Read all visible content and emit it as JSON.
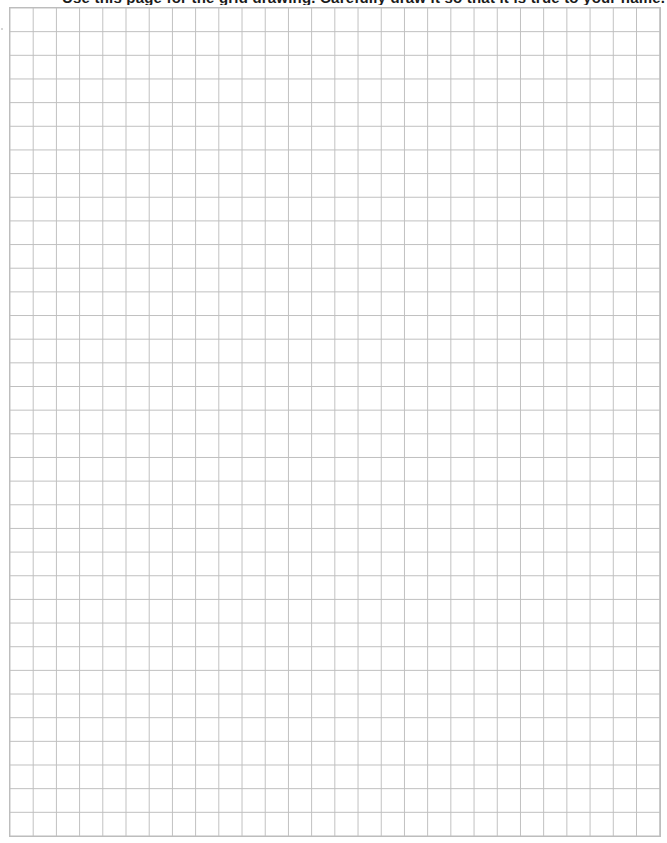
{
  "page": {
    "instruction_text": "Use this page for the grid drawing. Carefully draw it so that it is true to your name.",
    "instruction_visible": "partially clipped at top edge"
  },
  "grid": {
    "columns": 28,
    "rows": 35,
    "line_color": "#bfbfbf",
    "background_color": "#ffffff"
  }
}
